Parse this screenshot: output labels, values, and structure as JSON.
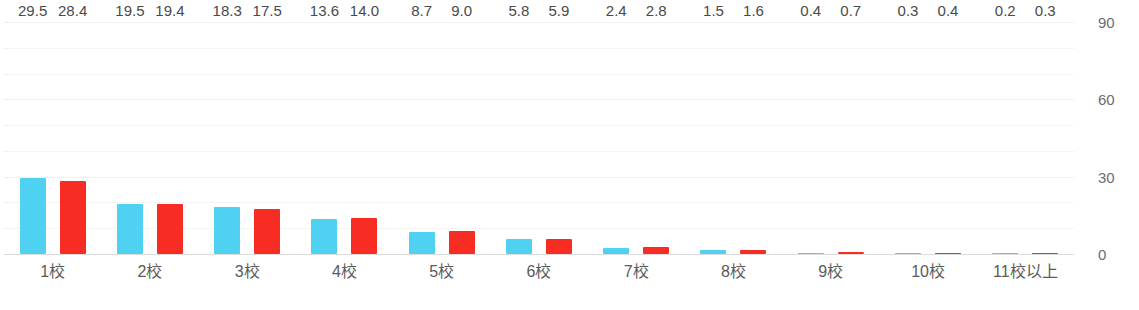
{
  "chart_data": {
    "type": "bar",
    "title": "",
    "subtitle": "",
    "xlabel": "",
    "ylabel": "",
    "ylim": [
      0,
      90
    ],
    "yticks": [
      0,
      30,
      60,
      90
    ],
    "ytick_labels": [
      "0",
      "30",
      "60",
      "90"
    ],
    "gridlines": [
      0,
      10,
      20,
      30,
      40,
      50,
      60,
      70,
      80,
      90
    ],
    "grid": true,
    "grid_style": "dotted",
    "y_axis_position": "right",
    "legend": "none",
    "categories": [
      "1校",
      "2校",
      "3校",
      "4校",
      "5校",
      "6校",
      "7校",
      "8校",
      "9校",
      "10校",
      "11校以上"
    ],
    "series": [
      {
        "name": "series-blue",
        "color": "#4fd2f2",
        "values": [
          29.5,
          19.5,
          18.3,
          13.6,
          8.7,
          5.8,
          2.4,
          1.5,
          0.4,
          0.3,
          0.2
        ],
        "labels": [
          "29.5",
          "19.5",
          "18.3",
          "13.6",
          "8.7",
          "5.8",
          "2.4",
          "1.5",
          "0.4",
          "0.3",
          "0.2"
        ]
      },
      {
        "name": "series-red",
        "color": "#f72c22",
        "values": [
          28.4,
          19.4,
          17.5,
          14.0,
          9.0,
          5.9,
          2.8,
          1.6,
          0.7,
          0.4,
          0.3
        ],
        "labels": [
          "28.4",
          "19.4",
          "17.5",
          "14.0",
          "9.0",
          "5.9",
          "2.8",
          "1.6",
          "0.7",
          "0.4",
          "0.3"
        ]
      }
    ],
    "colors": {
      "blue": "#4fd2f2",
      "red": "#f72c22",
      "grid": "#e9e9e9",
      "axis": "#dcdcdc",
      "tick_text": "#6d6d6d",
      "value_text": "#4a4a4a",
      "category_text": "#5a5a5a",
      "background": "#ffffff"
    }
  }
}
